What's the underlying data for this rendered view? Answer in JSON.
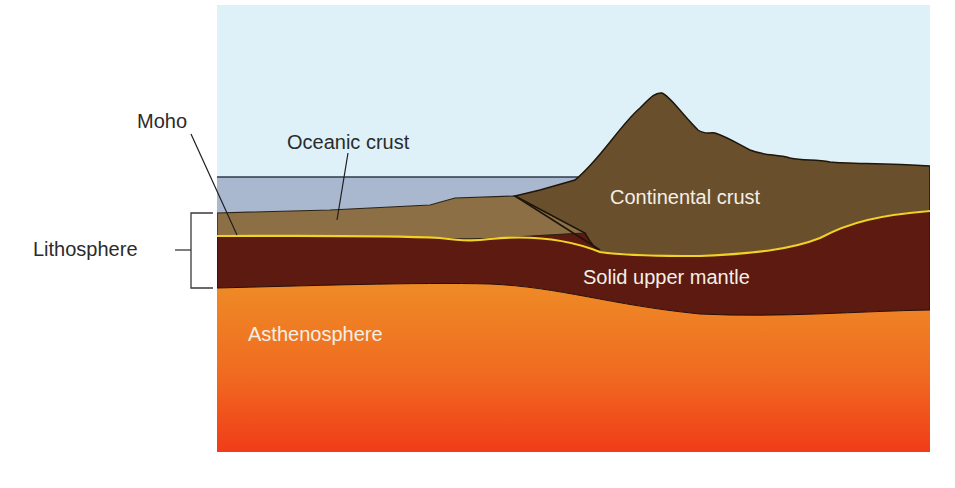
{
  "diagram": {
    "type": "earth-cross-section",
    "labels": {
      "moho": "Moho",
      "oceanic_crust": "Oceanic crust",
      "lithosphere": "Lithosphere",
      "continental_crust": "Continental crust",
      "solid_upper_mantle": "Solid upper mantle",
      "asthenosphere": "Asthenosphere"
    },
    "layers": [
      {
        "name": "Sky",
        "color": "#dff1f8"
      },
      {
        "name": "Ocean water",
        "color": "#a9b8cf"
      },
      {
        "name": "Oceanic crust",
        "color": "#8c6f45"
      },
      {
        "name": "Continental crust",
        "color": "#6a4f2c"
      },
      {
        "name": "Moho boundary",
        "color": "#f2d226"
      },
      {
        "name": "Solid upper mantle",
        "color": "#5c1a10"
      },
      {
        "name": "Asthenosphere",
        "color_top": "#ef8a24",
        "color_bottom": "#f0441a"
      }
    ]
  }
}
